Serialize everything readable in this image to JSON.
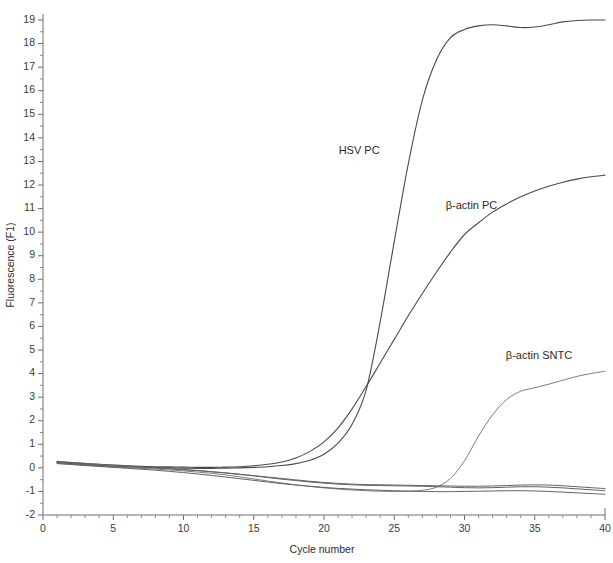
{
  "chart_data": {
    "type": "line",
    "title": "",
    "xlabel": "Cycle number",
    "ylabel": "Fluorescence (F1)",
    "xlim": [
      0,
      40
    ],
    "ylim": [
      -2,
      19
    ],
    "grid": false,
    "legend_position": "inline-annotations",
    "x_ticks": [
      0,
      5,
      10,
      15,
      20,
      25,
      30,
      35,
      40
    ],
    "x_tick_labels": [
      "0",
      "5",
      "10",
      "15",
      "20",
      "25",
      "30",
      "35",
      "40"
    ],
    "x_minor_tick_interval": 1,
    "y_ticks": [
      -2,
      -1,
      0,
      1,
      2,
      3,
      4,
      5,
      6,
      7,
      8,
      9,
      10,
      11,
      12,
      13,
      14,
      15,
      16,
      17,
      18,
      19
    ],
    "y_tick_labels": [
      "-2",
      "-1",
      "0",
      "1",
      "2",
      "3",
      "4",
      "5",
      "6",
      "7",
      "8",
      "9",
      "10",
      "11",
      "12",
      "13",
      "14",
      "15",
      "16",
      "17",
      "18",
      "19"
    ],
    "y_minor_tick_interval": 0.5,
    "x": [
      1,
      2,
      3,
      4,
      5,
      6,
      7,
      8,
      9,
      10,
      11,
      12,
      13,
      14,
      15,
      16,
      17,
      18,
      19,
      20,
      21,
      22,
      23,
      24,
      25,
      26,
      27,
      28,
      29,
      30,
      31,
      32,
      33,
      34,
      35,
      36,
      37,
      38,
      39,
      40
    ],
    "series": [
      {
        "name": "HSV PC",
        "color": "#4a4a4a",
        "label_x": 22.5,
        "label_y": 13.3,
        "values": [
          0.22,
          0.18,
          0.14,
          0.1,
          0.07,
          0.05,
          0.03,
          0.01,
          0.0,
          -0.01,
          -0.02,
          -0.02,
          -0.01,
          0.0,
          0.02,
          0.05,
          0.1,
          0.18,
          0.32,
          0.58,
          1.05,
          1.85,
          3.3,
          6.2,
          9.6,
          12.9,
          15.6,
          17.3,
          18.25,
          18.6,
          18.75,
          18.8,
          18.75,
          18.68,
          18.7,
          18.8,
          18.92,
          18.98,
          19.0,
          19.0
        ]
      },
      {
        "name": "β-actin PC",
        "color": "#4a4a4a",
        "label_x": 30.5,
        "label_y": 11.0,
        "values": [
          0.26,
          0.22,
          0.18,
          0.15,
          0.12,
          0.09,
          0.07,
          0.05,
          0.04,
          0.03,
          0.02,
          0.02,
          0.03,
          0.05,
          0.09,
          0.15,
          0.25,
          0.42,
          0.7,
          1.1,
          1.7,
          2.5,
          3.45,
          4.45,
          5.45,
          6.45,
          7.4,
          8.3,
          9.15,
          9.9,
          10.4,
          10.85,
          11.2,
          11.5,
          11.75,
          11.95,
          12.12,
          12.25,
          12.35,
          12.42
        ]
      },
      {
        "name": "β-actin SNTC",
        "color": "#7d7d7d",
        "label_x": 35.3,
        "label_y": 4.6,
        "values": [
          0.2,
          0.15,
          0.11,
          0.07,
          0.04,
          0.01,
          -0.02,
          -0.05,
          -0.09,
          -0.13,
          -0.18,
          -0.23,
          -0.3,
          -0.38,
          -0.47,
          -0.56,
          -0.64,
          -0.72,
          -0.79,
          -0.85,
          -0.9,
          -0.94,
          -0.97,
          -0.99,
          -1.0,
          -0.99,
          -0.95,
          -0.82,
          -0.45,
          0.3,
          1.35,
          2.25,
          2.9,
          3.25,
          3.4,
          3.55,
          3.72,
          3.88,
          4.0,
          4.1
        ]
      },
      {
        "name": "negative-baseline-1",
        "color": "#636363",
        "label_x": null,
        "label_y": null,
        "values": [
          0.24,
          0.19,
          0.15,
          0.11,
          0.08,
          0.05,
          0.02,
          -0.01,
          -0.04,
          -0.08,
          -0.12,
          -0.17,
          -0.22,
          -0.28,
          -0.34,
          -0.41,
          -0.48,
          -0.54,
          -0.6,
          -0.65,
          -0.69,
          -0.72,
          -0.74,
          -0.75,
          -0.76,
          -0.77,
          -0.78,
          -0.8,
          -0.82,
          -0.84,
          -0.85,
          -0.84,
          -0.82,
          -0.8,
          -0.8,
          -0.82,
          -0.85,
          -0.89,
          -0.93,
          -0.97
        ]
      },
      {
        "name": "negative-baseline-2",
        "color": "#636363",
        "label_x": null,
        "label_y": null,
        "values": [
          0.18,
          0.14,
          0.1,
          0.06,
          0.02,
          -0.02,
          -0.06,
          -0.1,
          -0.15,
          -0.2,
          -0.26,
          -0.32,
          -0.39,
          -0.46,
          -0.53,
          -0.6,
          -0.67,
          -0.73,
          -0.78,
          -0.83,
          -0.87,
          -0.9,
          -0.93,
          -0.95,
          -0.97,
          -0.99,
          -1.0,
          -1.01,
          -1.01,
          -1.0,
          -0.99,
          -0.98,
          -0.97,
          -0.97,
          -0.98,
          -1.0,
          -1.03,
          -1.06,
          -1.09,
          -1.12
        ]
      },
      {
        "name": "negative-baseline-3",
        "color": "#636363",
        "label_x": null,
        "label_y": null,
        "values": [
          0.28,
          0.23,
          0.19,
          0.15,
          0.11,
          0.08,
          0.04,
          0.01,
          -0.03,
          -0.07,
          -0.11,
          -0.16,
          -0.21,
          -0.27,
          -0.33,
          -0.39,
          -0.45,
          -0.51,
          -0.57,
          -0.62,
          -0.66,
          -0.69,
          -0.71,
          -0.72,
          -0.73,
          -0.74,
          -0.75,
          -0.76,
          -0.77,
          -0.78,
          -0.78,
          -0.77,
          -0.75,
          -0.73,
          -0.72,
          -0.73,
          -0.76,
          -0.8,
          -0.84,
          -0.88
        ]
      }
    ],
    "annotations": [
      {
        "text": "HSV PC",
        "x": 22.5,
        "y": 13.3
      },
      {
        "text": "β-actin PC",
        "x": 30.5,
        "y": 11.0
      },
      {
        "text": "β-actin SNTC",
        "x": 35.3,
        "y": 4.6
      }
    ]
  }
}
